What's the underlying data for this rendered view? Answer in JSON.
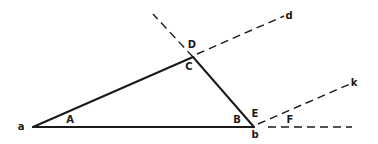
{
  "diagram": {
    "type": "geometry",
    "colors": {
      "stroke": "#1a1a1a",
      "background": "#ffffff"
    },
    "points": {
      "a": {
        "x": 33,
        "y": 127
      },
      "C": {
        "x": 193,
        "y": 57
      },
      "b": {
        "x": 254,
        "y": 127
      }
    },
    "solid_segments": [
      {
        "name": "side-aC",
        "from": "a",
        "to": "C"
      },
      {
        "name": "side-Cb",
        "from": "C",
        "to": "b"
      },
      {
        "name": "side-ab",
        "from": "a",
        "to": "b"
      }
    ],
    "dashed_segments": [
      {
        "name": "extension-bC-beyond-C",
        "x1": 193,
        "y1": 57,
        "x2": 153,
        "y2": 14
      },
      {
        "name": "ray-Cd",
        "x1": 197,
        "y1": 54,
        "x2": 284,
        "y2": 16
      },
      {
        "name": "ray-bk",
        "x1": 258,
        "y1": 124,
        "x2": 350,
        "y2": 84
      },
      {
        "name": "extension-ab-beyond-b",
        "x1": 268,
        "y1": 127,
        "x2": 352,
        "y2": 127
      }
    ],
    "labels": [
      {
        "id": "label-a",
        "text": "a",
        "x": 21,
        "y": 127
      },
      {
        "id": "label-A",
        "text": "A",
        "x": 70,
        "y": 120
      },
      {
        "id": "label-D",
        "text": "D",
        "x": 192,
        "y": 45
      },
      {
        "id": "label-C",
        "text": "C",
        "x": 189,
        "y": 67
      },
      {
        "id": "label-d",
        "text": "d",
        "x": 289,
        "y": 16
      },
      {
        "id": "label-B",
        "text": "B",
        "x": 237,
        "y": 120
      },
      {
        "id": "label-E",
        "text": "E",
        "x": 255,
        "y": 114
      },
      {
        "id": "label-b",
        "text": "b",
        "x": 255,
        "y": 135
      },
      {
        "id": "label-k",
        "text": "k",
        "x": 354,
        "y": 83
      },
      {
        "id": "label-F",
        "text": "F",
        "x": 290,
        "y": 120
      }
    ]
  }
}
